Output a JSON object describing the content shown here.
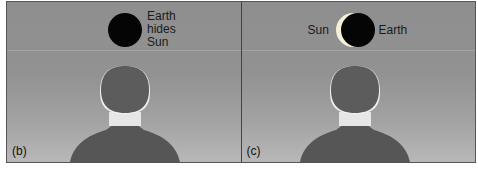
{
  "panels": [
    {
      "id": "b",
      "tag": "(b)",
      "label_lines": [
        "Earth",
        "hides",
        "Sun"
      ],
      "description": "Earth fully covers the Sun (total eclipse seen from Moon)"
    },
    {
      "id": "c",
      "tag": "(c)",
      "label_left": "Sun",
      "label_right": "Earth",
      "description": "Sun peeking from behind Earth"
    }
  ],
  "colors": {
    "sky": "#929292",
    "earth_disk": "#050505",
    "sun": "#f4f0d8",
    "head": "#5a5a5a",
    "collar": "#e8e8e8",
    "body": "#555555"
  }
}
